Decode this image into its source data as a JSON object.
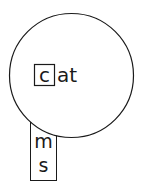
{
  "diagram": {
    "type": "phonics-word-slider",
    "wheel": {
      "onset": "c",
      "rime": "at"
    },
    "strip": {
      "letters": [
        "m",
        "s"
      ]
    },
    "colors": {
      "stroke": "#1a1a1a",
      "background": "#ffffff",
      "text": "#1a1a1a"
    }
  }
}
